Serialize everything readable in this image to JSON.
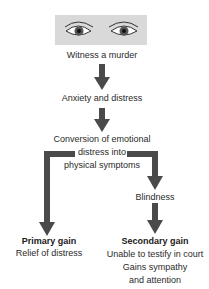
{
  "diagram": {
    "colors": {
      "arrow": "#4a4a4a",
      "eye_box": "#d9d9d9",
      "text": "#2a2a2a"
    },
    "image": {
      "icon": "eyes-icon",
      "description": "two eyes"
    },
    "nodes": {
      "witness": "Witness a murder",
      "anxiety": "Anxiety and distress",
      "conversion": [
        "Conversion of emotional",
        "distress into",
        "physical symptoms"
      ],
      "blindness": "Blindness",
      "primary_gain": {
        "title": "Primary gain",
        "lines": [
          "Relief of distress"
        ]
      },
      "secondary_gain": {
        "title": "Secondary gain",
        "lines": [
          "Unable to testify in court",
          "Gains sympathy",
          "and attention"
        ]
      }
    }
  }
}
